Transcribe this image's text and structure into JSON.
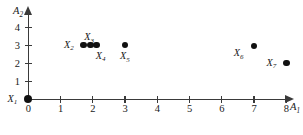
{
  "chart_data": {
    "type": "scatter",
    "title": "",
    "xlabel": "A1",
    "ylabel": "A2",
    "xlabel_display": "A",
    "xlabel_sub": "1",
    "ylabel_display": "A",
    "ylabel_sub": "2",
    "xlim": [
      0,
      8
    ],
    "ylim": [
      0,
      4.6
    ],
    "grid": false,
    "legend": "none",
    "x_ticks": [
      0,
      1,
      2,
      3,
      4,
      5,
      6,
      7,
      8
    ],
    "x_tick_labels": [
      "0",
      "1",
      "2",
      "3",
      "4",
      "5",
      "6",
      "7",
      "8"
    ],
    "y_ticks": [
      1,
      2,
      3,
      4
    ],
    "y_tick_labels": [
      "1",
      "2",
      "3",
      "4"
    ],
    "origin_label": "0",
    "points": [
      {
        "id": "X1",
        "label_base": "X",
        "label_sub": "1",
        "x": 0.0,
        "y": 0.0,
        "label_pos": "left",
        "radius": 4.2
      },
      {
        "id": "X2",
        "label_base": "X",
        "label_sub": "2",
        "x": 1.72,
        "y": 3.0,
        "label_pos": "left",
        "radius": 3.3
      },
      {
        "id": "X3",
        "label_base": "X",
        "label_sub": "3",
        "x": 1.92,
        "y": 3.0,
        "label_pos": "above",
        "radius": 3.3
      },
      {
        "id": "X4",
        "label_base": "X",
        "label_sub": "4",
        "x": 2.12,
        "y": 3.0,
        "label_pos": "below-right",
        "radius": 3.3
      },
      {
        "id": "X5",
        "label_base": "X",
        "label_sub": "5",
        "x": 3.0,
        "y": 3.0,
        "label_pos": "below",
        "radius": 3.3
      },
      {
        "id": "X6",
        "label_base": "X",
        "label_sub": "6",
        "x": 7.0,
        "y": 2.95,
        "label_pos": "below-left",
        "radius": 3.3
      },
      {
        "id": "X7",
        "label_base": "X",
        "label_sub": "7",
        "x": 8.0,
        "y": 2.0,
        "label_pos": "left",
        "radius": 3.3
      }
    ],
    "colors": {
      "point": "#111111",
      "axis": "#3a3a3a",
      "text": "#1a1a1a",
      "background": "#ffffff"
    }
  }
}
